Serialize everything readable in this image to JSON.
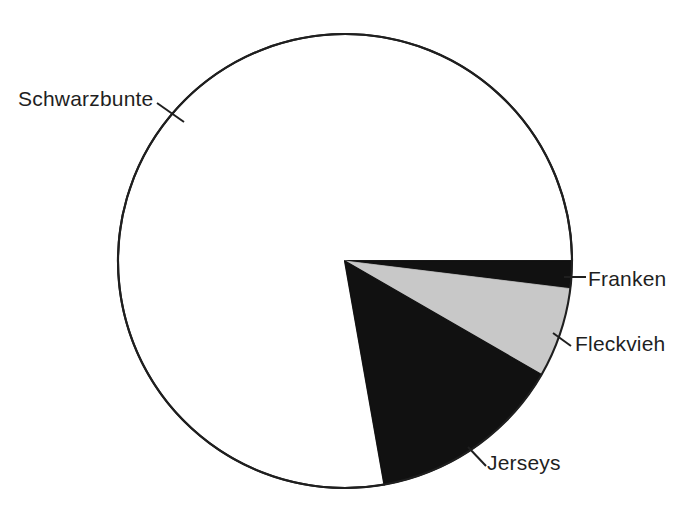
{
  "chart_data": {
    "type": "pie",
    "title": "",
    "subtitle": "",
    "xlabel": "",
    "ylabel": "",
    "legend_position": "none",
    "grid": false,
    "labels_position": "outside-with-leader-lines",
    "start_angle_deg": 0,
    "direction": "clockwise",
    "categories": [
      "Franken",
      "Fleckvieh",
      "Jerseys",
      "Schwarzbunte"
    ],
    "values": [
      1.9,
      6.4,
      13.9,
      77.8
    ],
    "units": "percent",
    "slices": [
      {
        "label": "Franken",
        "value": 1.9,
        "start_angle_deg": 0,
        "end_angle_deg": 7,
        "color": "#111111",
        "fill": "black"
      },
      {
        "label": "Fleckvieh",
        "value": 6.4,
        "start_angle_deg": 7,
        "end_angle_deg": 30,
        "color": "#c8c8c8",
        "fill": "light-grey"
      },
      {
        "label": "Jerseys",
        "value": 13.9,
        "start_angle_deg": 30,
        "end_angle_deg": 80,
        "color": "#111111",
        "fill": "black"
      },
      {
        "label": "Schwarzbunte",
        "value": 77.8,
        "start_angle_deg": 80,
        "end_angle_deg": 360,
        "color": "#ffffff",
        "fill": "white"
      }
    ]
  },
  "labels": {
    "schwarzbunte": "Schwarzbunte",
    "franken": "Franken",
    "fleckvieh": "Fleckvieh",
    "jerseys": "Jerseys"
  },
  "colors": {
    "background": "#ffffff",
    "outline": "#1f1f1f",
    "black_slice": "#111111",
    "grey_slice": "#c8c8c8",
    "white_slice": "#ffffff",
    "text": "#1f1f1f",
    "leader_line": "#1f1f1f"
  },
  "geometry": {
    "center_x": 345,
    "center_y": 261,
    "radius": 227
  }
}
